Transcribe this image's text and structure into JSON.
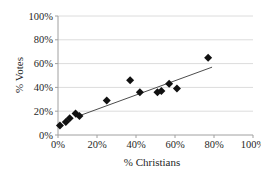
{
  "chart_data": {
    "type": "scatter",
    "title": "",
    "xlabel": "% Christians",
    "ylabel": "% Votes",
    "x_ticks": [
      "0%",
      "20%",
      "40%",
      "60%",
      "80%",
      "100%"
    ],
    "y_ticks": [
      "0%",
      "20%",
      "40%",
      "60%",
      "80%",
      "100%"
    ],
    "x_tick_values": [
      0,
      20,
      40,
      60,
      80,
      100
    ],
    "y_tick_values": [
      0,
      20,
      40,
      60,
      80,
      100
    ],
    "xlim": [
      0,
      100
    ],
    "ylim": [
      0,
      100
    ],
    "grid": "horizontal",
    "legend": "none",
    "marker": "diamond",
    "points": [
      {
        "x": 1,
        "y": 8
      },
      {
        "x": 4,
        "y": 11
      },
      {
        "x": 6,
        "y": 14
      },
      {
        "x": 9,
        "y": 18
      },
      {
        "x": 11,
        "y": 16
      },
      {
        "x": 25,
        "y": 29
      },
      {
        "x": 37,
        "y": 46
      },
      {
        "x": 42,
        "y": 36
      },
      {
        "x": 51,
        "y": 36
      },
      {
        "x": 53,
        "y": 37
      },
      {
        "x": 57,
        "y": 43
      },
      {
        "x": 61,
        "y": 39
      },
      {
        "x": 77,
        "y": 65
      }
    ],
    "trendline": {
      "x1": 9,
      "y1": 15,
      "x2": 79,
      "y2": 57
    }
  },
  "colors": {
    "background": "#ffffff",
    "marker": "#111111",
    "trendline": "#4d4d4d",
    "gridline": "#dcdcdc",
    "axis": "#a0a0a0",
    "text": "#1f1f1f"
  }
}
